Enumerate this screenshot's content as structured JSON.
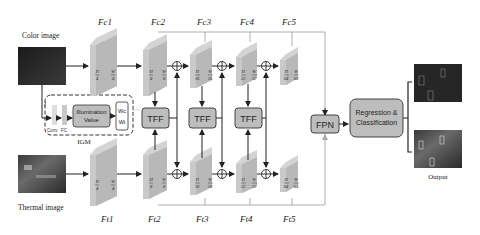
{
  "inputs": {
    "color_label": "Color image",
    "thermal_label": "Thermal image"
  },
  "igm": {
    "label": "IGM",
    "conv_label": "Conv",
    "fc_label": "FC",
    "illumination_line1": "Illumination",
    "illumination_line2": "Value",
    "wc": "Wc",
    "wt": "Wt",
    "i_label": "I"
  },
  "color_features": [
    {
      "label": "Fc1",
      "h": "H",
      "hden": "4",
      "w": "W",
      "wden": "4"
    },
    {
      "label": "Fc2",
      "h": "H",
      "hden": "8",
      "w": "W",
      "wden": "8"
    },
    {
      "label": "Fc3",
      "h": "H",
      "hden": "16",
      "w": "W",
      "wden": "16"
    },
    {
      "label": "Fc4",
      "h": "H",
      "hden": "32",
      "w": "W",
      "wden": "32"
    },
    {
      "label": "Fc5",
      "h": "H",
      "hden": "64",
      "w": "W",
      "wden": "64"
    }
  ],
  "thermal_features": [
    {
      "label": "Ft1",
      "h": "H",
      "hden": "4",
      "w": "W",
      "wden": "4"
    },
    {
      "label": "Ft2",
      "h": "H",
      "hden": "8",
      "w": "W",
      "wden": "8"
    },
    {
      "label": "Ft3",
      "h": "H",
      "hden": "16",
      "w": "W",
      "wden": "16"
    },
    {
      "label": "Ft4",
      "h": "H",
      "hden": "32",
      "w": "W",
      "wden": "32"
    },
    {
      "label": "Ft5",
      "h": "H",
      "hden": "64",
      "w": "W",
      "wden": "64"
    }
  ],
  "fusion": {
    "tff_labels": [
      "TFF",
      "TFF",
      "TFF"
    ],
    "fpn_label": "FPN",
    "head_line1": "Regression &",
    "head_line2": "Classification"
  },
  "output": {
    "label": "Output"
  },
  "colors": {
    "feature_face": "#b8b8b8",
    "feature_side": "#d4d4d4",
    "box_fill": "#bdbdbd",
    "line": "#222222",
    "thin_line": "#9a9a9a"
  }
}
